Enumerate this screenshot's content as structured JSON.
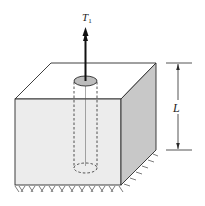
{
  "figure": {
    "force_label": "T",
    "force_subscript": "1",
    "dimension_label": "L",
    "colors": {
      "front_face": "#ececec",
      "side_face": "#c8c8c8",
      "top_face": "#ffffff",
      "bar_top": "#bdbdbd",
      "line": "#2a2a2a"
    }
  }
}
